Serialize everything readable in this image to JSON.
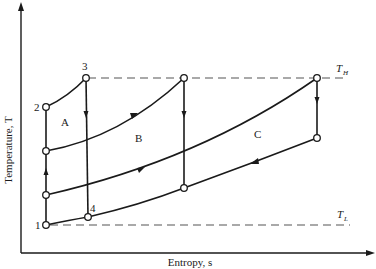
{
  "diagram": {
    "type": "T-s diagram",
    "axes": {
      "y_label": "Temperature, T",
      "x_label": "Entropy, s"
    },
    "reference_lines": {
      "high": {
        "label_main": "T",
        "label_sub": "H"
      },
      "low": {
        "label_main": "T",
        "label_sub": "L"
      }
    },
    "state_points": [
      {
        "id": "1",
        "label": "1"
      },
      {
        "id": "2",
        "label": "2"
      },
      {
        "id": "3",
        "label": "3"
      },
      {
        "id": "4",
        "label": "4"
      }
    ],
    "regions": [
      {
        "id": "A",
        "label": "A"
      },
      {
        "id": "B",
        "label": "B"
      },
      {
        "id": "C",
        "label": "C"
      }
    ]
  }
}
